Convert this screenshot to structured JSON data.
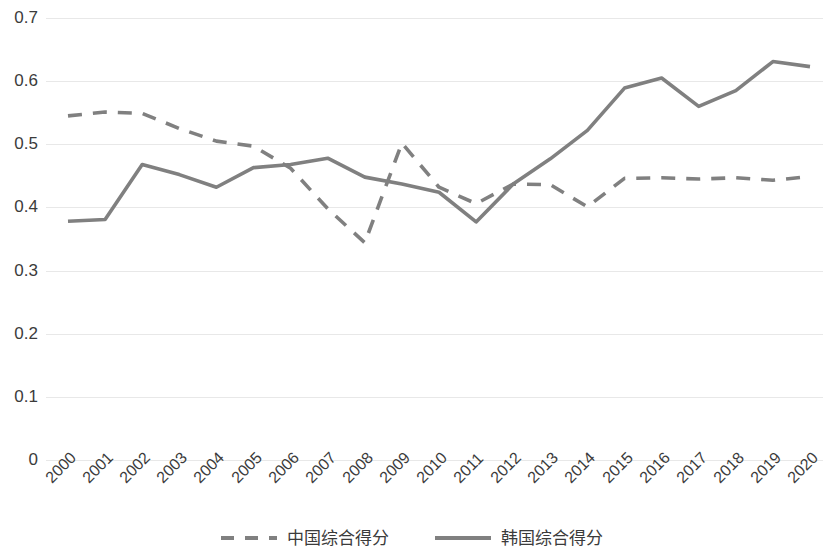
{
  "chart_data": {
    "type": "line",
    "title": "",
    "subtitle": "",
    "xlabel": "",
    "ylabel": "",
    "categories": [
      "2000",
      "2001",
      "2002",
      "2003",
      "2004",
      "2005",
      "2006",
      "2007",
      "2008",
      "2009",
      "2010",
      "2011",
      "2012",
      "2013",
      "2014",
      "2015",
      "2016",
      "2017",
      "2018",
      "2019",
      "2020"
    ],
    "ylim": [
      0,
      0.7
    ],
    "ytick_labels": [
      "0.7",
      "0.6",
      "0.5",
      "0.4",
      "0.3",
      "0.2",
      "0.1",
      "0"
    ],
    "ytick_values": [
      0.7,
      0.6,
      0.5,
      0.4,
      0.3,
      0.2,
      0.1,
      0
    ],
    "grid": true,
    "legend_position": "bottom",
    "series": [
      {
        "name": "中国综合得分",
        "style": "dashed",
        "color": "#808080",
        "values": [
          0.545,
          0.551,
          0.549,
          0.525,
          0.505,
          0.497,
          0.462,
          0.398,
          0.344,
          0.502,
          0.432,
          0.406,
          0.437,
          0.436,
          0.401,
          0.446,
          0.447,
          0.445,
          0.447,
          0.443,
          0.449
        ]
      },
      {
        "name": "韩国综合得分",
        "style": "solid",
        "color": "#808080",
        "values": [
          0.378,
          0.381,
          0.468,
          0.452,
          0.432,
          0.463,
          0.468,
          0.478,
          0.448,
          0.437,
          0.424,
          0.377,
          0.437,
          0.477,
          0.522,
          0.589,
          0.605,
          0.56,
          0.585,
          0.631,
          0.623
        ]
      }
    ]
  },
  "legend": {
    "items": [
      {
        "label": "中国综合得分",
        "style": "dashed"
      },
      {
        "label": "韩国综合得分",
        "style": "solid"
      }
    ]
  },
  "colors": {
    "line": "#808080",
    "grid": "#e8e8e8",
    "text": "#3b3b3b",
    "background": "#ffffff"
  }
}
